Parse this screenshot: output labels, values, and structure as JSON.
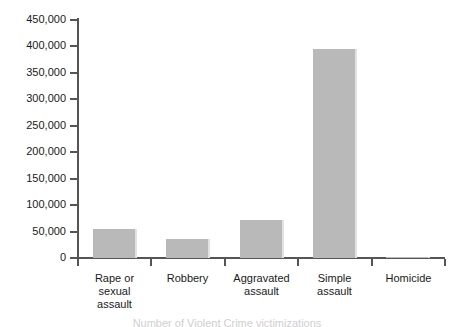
{
  "chart_data": {
    "type": "bar",
    "title": "",
    "subtitle": "",
    "xlabel": "",
    "ylabel": "",
    "ylim": [
      0,
      450000
    ],
    "ytick_step": 50000,
    "grid": false,
    "legend": null,
    "categories": [
      "Rape or sexual assault",
      "Robbery",
      "Aggravated assault",
      "Simple assault",
      "Homicide"
    ],
    "values": [
      55000,
      36000,
      72000,
      396000,
      2500
    ],
    "ytick_labels": [
      "0",
      "50,000",
      "100,000",
      "150,000",
      "200,000",
      "250,000",
      "300,000",
      "350,000",
      "400,000",
      "450,000"
    ],
    "category_lines": [
      [
        "Rape or",
        "sexual",
        "assault"
      ],
      [
        "Robbery"
      ],
      [
        "Aggravated",
        "assault"
      ],
      [
        "Simple",
        "assault"
      ],
      [
        "Homicide"
      ]
    ],
    "bar_color": "#b9b9b9",
    "bar_edge_color": "#e2e2e2",
    "axis_color": "#555555"
  },
  "caption": {
    "text": "Number of Violent Crime victimizations"
  }
}
